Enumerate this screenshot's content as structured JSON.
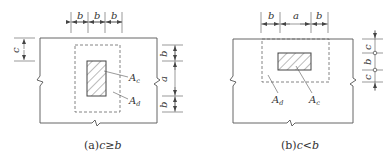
{
  "colors": {
    "line": "#555555",
    "text": "#333333",
    "background": "#ffffff"
  },
  "diagram_a": {
    "caption_prefix": "(a)",
    "caption_expr": "c≥b",
    "top_dims": [
      "b",
      "b",
      "b"
    ],
    "right_dims": [
      "b",
      "a",
      "b"
    ],
    "left_dim": "c",
    "label_column": "A",
    "label_column_sub": "c",
    "label_area": "A",
    "label_area_sub": "d"
  },
  "diagram_b": {
    "caption_prefix": "(b)",
    "caption_expr": "c<b",
    "top_dims": [
      "b",
      "a",
      "b"
    ],
    "right_dims": [
      "c",
      "b",
      "c"
    ],
    "label_column": "A",
    "label_column_sub": "c",
    "label_area": "A",
    "label_area_sub": "d"
  }
}
